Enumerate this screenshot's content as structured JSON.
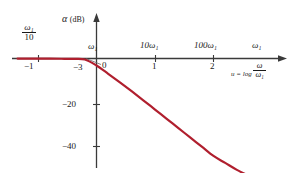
{
  "chart_data": {
    "type": "line",
    "title": "",
    "subtitle": "",
    "ylabel": "α (dB)",
    "ylabel_symbol": "α",
    "ylabel_unit": "(dB)",
    "xlabel": "u = log ω/ω₁",
    "xlabel_prefix": "u = log",
    "xlabel_frac_num": "ω",
    "xlabel_frac_den": "ω₁",
    "grid": false,
    "legend": "none",
    "xlim": [
      -1.35,
      2.9
    ],
    "ylim": [
      -52,
      6
    ],
    "x_ticks_lower": [
      "−1",
      "0",
      "1",
      "2"
    ],
    "x_tick_values": [
      -1,
      0,
      1,
      2
    ],
    "x_ticks_upper": [
      "ω₁/10",
      "ω₁",
      "10ω₁",
      "100ω₁",
      "ω₁"
    ],
    "x_tick_upper_w1_over_10_num": "ω₁",
    "x_tick_upper_w1_over_10_den": "10",
    "x_tick_upper_w1": "ω₁",
    "x_tick_upper_10w1": "10ω₁",
    "x_tick_upper_100w1": "100ω₁",
    "x_tick_upper_w1_right": "ω₁",
    "y_ticks": [
      "−3",
      "−20",
      "−40"
    ],
    "y_tick_values": [
      -3,
      -20,
      -40
    ],
    "curve_color": "#b01f2e",
    "axis_color": "#3a3a3a",
    "series": [
      {
        "name": "α(u) = −10 log(1 + 10^(2u))",
        "x": [
          -1.35,
          -1.2,
          -1.0,
          -0.8,
          -0.6,
          -0.4,
          -0.2,
          0.0,
          0.2,
          0.4,
          0.6,
          0.8,
          1.0,
          1.2,
          1.4,
          1.6,
          1.8,
          2.0,
          2.2,
          2.4,
          2.6,
          2.75
        ],
        "y": [
          -0.02,
          -0.03,
          -0.04,
          -0.07,
          -0.11,
          -0.17,
          -0.41,
          -3.0,
          -6.6,
          -10.3,
          -14.1,
          -18.0,
          -22.0,
          -26.0,
          -30.0,
          -34.0,
          -38.0,
          -42.0,
          -45.0,
          -48.0,
          -50.5,
          -52.0
        ]
      }
    ],
    "annotations": [
      {
        "name": "zero-leader",
        "label": "0",
        "points_to_x": 0.0,
        "points_to_y": 0.0
      }
    ]
  }
}
